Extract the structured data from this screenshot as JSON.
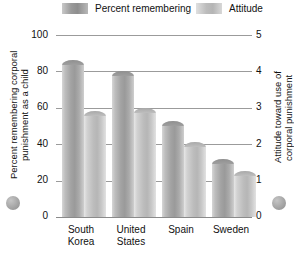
{
  "legend": {
    "items": [
      {
        "label": "Percent remembering",
        "key": "percent-remembering",
        "color": "#9a9a9a"
      },
      {
        "label": "Attitude",
        "key": "attitude",
        "color": "#bcbcbc"
      }
    ]
  },
  "axes": {
    "left": {
      "title": "Percent remembering corporal punishment as a child",
      "ticks": [
        "100",
        "80",
        "60",
        "40",
        "20",
        "0"
      ],
      "min": 0,
      "max": 100
    },
    "right": {
      "title": "Attitude toward use of corporal punishment",
      "ticks": [
        "5",
        "4",
        "3",
        "2",
        "1",
        "0"
      ],
      "min": 0,
      "max": 5
    }
  },
  "categories": [
    {
      "line1": "South",
      "line2": "Korea"
    },
    {
      "line1": "United",
      "line2": "States"
    },
    {
      "line1": "Spain",
      "line2": ""
    },
    {
      "line1": "Sweden",
      "line2": ""
    }
  ],
  "chart_data": {
    "type": "bar",
    "title": "",
    "subtitle": "",
    "categories": [
      "South Korea",
      "United States",
      "Spain",
      "Sweden"
    ],
    "series": [
      {
        "name": "Percent remembering",
        "axis": "left",
        "unit": "percent",
        "values": [
          86,
          80,
          53,
          32
        ]
      },
      {
        "name": "Attitude",
        "axis": "right",
        "unit": "scale 0-5",
        "values": [
          2.9,
          3.0,
          2.05,
          1.25
        ]
      }
    ],
    "xlabel": "",
    "ylabel": "Percent remembering corporal punishment as a child",
    "ylabel_right": "Attitude toward use of corporal punishment",
    "ylim": [
      0,
      100
    ],
    "ylim_right": [
      0,
      5
    ],
    "yticks": [
      0,
      20,
      40,
      60,
      80,
      100
    ],
    "yticks_right": [
      0,
      1,
      2,
      3,
      4,
      5
    ],
    "grid": true,
    "legend_position": "top",
    "bar_style": "3d-cylinder"
  }
}
